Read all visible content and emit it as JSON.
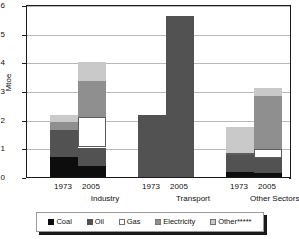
{
  "chart_data": {
    "type": "bar",
    "subtype": "stacked-vertical",
    "title": "",
    "xlabel": "",
    "ylabel": "Mtoe",
    "ylim": [
      0,
      6
    ],
    "yticks": [
      0,
      1,
      2,
      3,
      4,
      5,
      6
    ],
    "ytick_labels": [
      "0",
      "1",
      "2",
      "3",
      "4",
      "5",
      "6"
    ],
    "grid": true,
    "grid_axis": "y",
    "legend_position": "bottom",
    "categories": [
      "Industry 1973",
      "Industry 2005",
      "Transport 1973",
      "Transport 2005",
      "Other Sectors 1973",
      "Other Sectors 2005"
    ],
    "groups": [
      {
        "name": "Industry",
        "years": [
          "1973",
          "2005"
        ]
      },
      {
        "name": "Transport",
        "years": [
          "1973",
          "2005"
        ]
      },
      {
        "name": "Other Sectors****",
        "years": [
          "1973",
          "2005"
        ]
      }
    ],
    "series": [
      {
        "name": "Coal",
        "color": "#0d0d0d",
        "values": [
          0.7,
          0.4,
          0.0,
          0.0,
          0.18,
          0.13
        ]
      },
      {
        "name": "Oil",
        "color": "#525252",
        "values": [
          0.93,
          0.63,
          2.15,
          5.6,
          0.6,
          0.55
        ]
      },
      {
        "name": "Gas",
        "color": "#ffffff",
        "values": [
          0.0,
          1.05,
          0.0,
          0.0,
          0.05,
          0.3
        ]
      },
      {
        "name": "Electricity",
        "color": "#8f8f8f",
        "values": [
          0.3,
          1.28,
          0.0,
          0.0,
          0.0,
          1.85
        ]
      },
      {
        "name": "Other*****",
        "color": "#c9c9c9",
        "values": [
          0.22,
          0.64,
          0.0,
          0.0,
          0.9,
          0.28
        ]
      }
    ],
    "totals": [
      2.15,
      4.0,
      2.15,
      5.6,
      1.73,
      3.11
    ],
    "legend_entries": [
      "Coal",
      "Oil",
      "Gas",
      "Electricity",
      "Other*****"
    ]
  },
  "axis": {
    "ylabel": "Mtoe",
    "ytick_labels": [
      "6",
      "5",
      "4",
      "3",
      "2",
      "1",
      "0"
    ]
  },
  "xaxis": {
    "groups": [
      {
        "label": "Industry",
        "years": [
          "1973",
          "2005"
        ]
      },
      {
        "label": "Transport",
        "years": [
          "1973",
          "2005"
        ]
      },
      {
        "label": "Other Sectors****",
        "years": [
          "1973",
          "2005"
        ]
      }
    ]
  },
  "legend": {
    "items": [
      {
        "label": "Coal",
        "swatch": "coal-swatch"
      },
      {
        "label": "Oil",
        "swatch": "oil-swatch"
      },
      {
        "label": "Gas",
        "swatch": "gas-swatch"
      },
      {
        "label": "Electricity",
        "swatch": "electricity-swatch"
      },
      {
        "label": "Other*****",
        "swatch": "other-swatch"
      }
    ]
  }
}
